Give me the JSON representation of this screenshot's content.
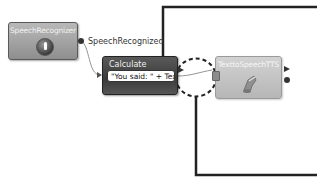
{
  "diagram": {
    "blocks": {
      "speech_recognizer": {
        "title": "SpeechRecognizer",
        "icon": "microphone-icon"
      },
      "calculate": {
        "title": "Calculate",
        "expression": "\"You said: \" + Text"
      },
      "text_to_speech": {
        "title": "TexttoSpeechTTS",
        "icon": "speaker-icon"
      }
    },
    "connections": [
      {
        "from": "SpeechRecognizer",
        "event": "SpeechRecognized",
        "to": "Calculate"
      },
      {
        "from": "Calculate",
        "to": "TexttoSpeechTTS"
      }
    ],
    "labels": {
      "speech_recognized": "SpeechRecognized"
    },
    "highlight": {
      "type": "dashed-ellipse",
      "around": "Calculate -> TexttoSpeechTTS link"
    },
    "colors": {
      "speech_recognizer_fill": "#a4a4a4",
      "calculate_fill": "#454545",
      "tts_fill": "#c4c4c4",
      "callout_line": "#222222"
    }
  }
}
